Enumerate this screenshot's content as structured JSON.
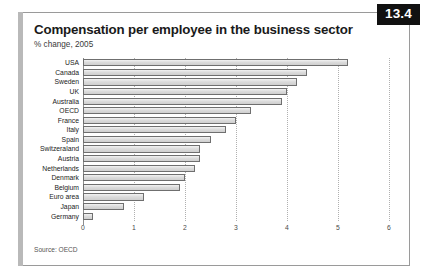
{
  "figure": {
    "badge_number": "13.4",
    "title": "Compensation per employee in the business sector",
    "subtitle": "% change, 2005",
    "source": "Source: OECD",
    "accent_color": "#b9b9b9",
    "badge_color": "#111111",
    "bar_fill": "#dcdcdc",
    "bar_stroke": "#6f6f6f"
  },
  "chart_data": {
    "type": "bar",
    "orientation": "horizontal",
    "title": "Compensation per employee in the business sector",
    "subtitle": "% change, 2005",
    "xlabel": "",
    "ylabel": "",
    "xlim": [
      0,
      6
    ],
    "xticks": [
      0,
      1,
      2,
      3,
      4,
      5,
      6
    ],
    "xtick_labels": [
      "0",
      "1",
      "2",
      "3",
      "4",
      "5",
      "6"
    ],
    "grid": "vertical dotted gridlines at each integer tick",
    "legend": "none",
    "source": "Source: OECD",
    "categories": [
      "USA",
      "Canada",
      "Sweden",
      "UK",
      "Australia",
      "OECD",
      "France",
      "Italy",
      "Spain",
      "Switzeraland",
      "Austria",
      "Netherlands",
      "Denmark",
      "Belgium",
      "Euro area",
      "Japan",
      "Germany"
    ],
    "values": [
      5.2,
      4.4,
      4.2,
      4.0,
      3.9,
      3.3,
      3.0,
      2.8,
      2.5,
      2.3,
      2.3,
      2.2,
      2.0,
      1.9,
      1.2,
      0.8,
      0.2
    ]
  }
}
